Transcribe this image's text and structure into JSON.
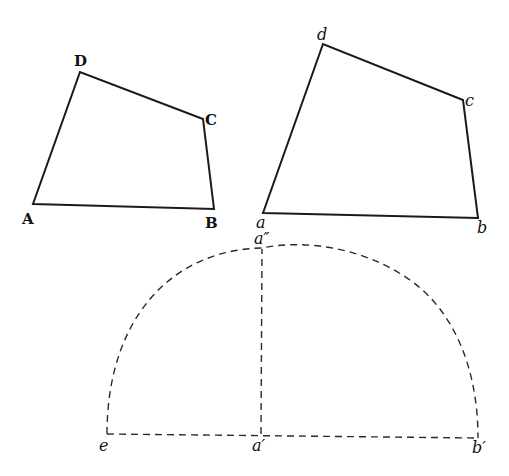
{
  "figure": {
    "quad_upper": {
      "labels": {
        "A": "A",
        "B": "B",
        "C": "C",
        "D": "D"
      },
      "points": {
        "A": [
          33,
          204
        ],
        "B": [
          214,
          209
        ],
        "C": [
          203,
          119
        ],
        "D": [
          80,
          72
        ]
      }
    },
    "quad_lower": {
      "labels": {
        "a": "a",
        "b": "b",
        "c": "c",
        "d": "d"
      },
      "points": {
        "a": [
          263,
          213
        ],
        "b": [
          478,
          218
        ],
        "c": [
          463,
          100
        ],
        "d": [
          323,
          44
        ]
      }
    },
    "construction": {
      "labels": {
        "e": "e",
        "a1": "a′",
        "b1": "b′",
        "a2": "a″"
      },
      "points": {
        "e": [
          107,
          434
        ],
        "a1": [
          261,
          434
        ],
        "b1": [
          478,
          438
        ],
        "a2": [
          262,
          249
        ]
      },
      "arc_top": [
        298,
        243
      ]
    }
  }
}
